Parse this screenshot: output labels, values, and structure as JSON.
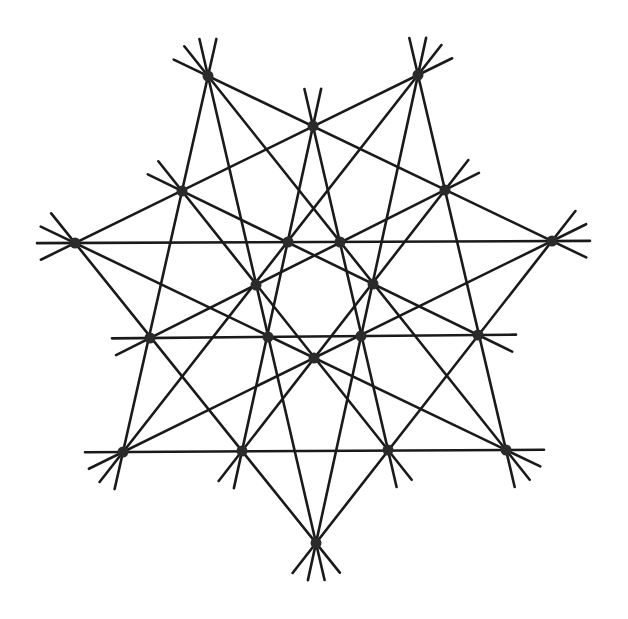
{
  "diagram": {
    "type": "point-line configuration",
    "symmetry": "7-fold",
    "line_color": "#1a1a1a",
    "point_color": "#2b2b2b",
    "points_per_line": 4,
    "extension_px": 38,
    "points": [
      {
        "id": "tip-1",
        "x": 208,
        "y": 76
      },
      {
        "id": "tip-2",
        "x": 418,
        "y": 75
      },
      {
        "id": "tip-3",
        "x": 552,
        "y": 241
      },
      {
        "id": "tip-4",
        "x": 506,
        "y": 450
      },
      {
        "id": "tip-5",
        "x": 316,
        "y": 543
      },
      {
        "id": "tip-6",
        "x": 123,
        "y": 452
      },
      {
        "id": "tip-7",
        "x": 75,
        "y": 243
      },
      {
        "id": "mid-1",
        "x": 313,
        "y": 126
      },
      {
        "id": "mid-2",
        "x": 445,
        "y": 190
      },
      {
        "id": "mid-3",
        "x": 478,
        "y": 335
      },
      {
        "id": "mid-4",
        "x": 388,
        "y": 450
      },
      {
        "id": "mid-5",
        "x": 242,
        "y": 451
      },
      {
        "id": "mid-6",
        "x": 150,
        "y": 338
      },
      {
        "id": "mid-7",
        "x": 182,
        "y": 191
      },
      {
        "id": "inner-1",
        "x": 288,
        "y": 242
      },
      {
        "id": "inner-2",
        "x": 340,
        "y": 242
      },
      {
        "id": "inner-3",
        "x": 373,
        "y": 284
      },
      {
        "id": "inner-4",
        "x": 361,
        "y": 336
      },
      {
        "id": "inner-5",
        "x": 314,
        "y": 358
      },
      {
        "id": "inner-6",
        "x": 268,
        "y": 337
      },
      {
        "id": "inner-7",
        "x": 256,
        "y": 285
      }
    ]
  }
}
